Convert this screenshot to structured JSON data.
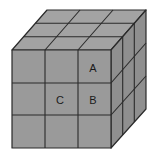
{
  "diagram": {
    "type": "cube-3x3x3",
    "colors": {
      "front_face": "#9a9a9a",
      "top_face": "#a3a3a3",
      "side_face": "#8f8f8f",
      "edge": "#2a2a2a",
      "label": "#1a1a1a",
      "background": "#ffffff"
    },
    "labels": [
      {
        "text": "A",
        "x": 93,
        "y": 68
      },
      {
        "text": "B",
        "x": 93,
        "y": 100
      },
      {
        "text": "C",
        "x": 60,
        "y": 100
      }
    ]
  }
}
